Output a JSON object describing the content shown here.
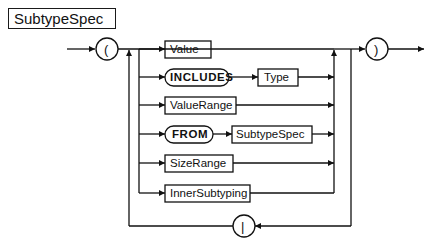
{
  "title": "SubtypeSpec",
  "diagram": {
    "type": "syntax-railroad",
    "open_symbol": "(",
    "close_symbol": ")",
    "separator_symbol": "|",
    "alternatives": [
      {
        "items": [
          {
            "kind": "nonterminal",
            "label": "Value"
          }
        ]
      },
      {
        "items": [
          {
            "kind": "keyword",
            "label": "INCLUDES"
          },
          {
            "kind": "nonterminal",
            "label": "Type"
          }
        ]
      },
      {
        "items": [
          {
            "kind": "nonterminal",
            "label": "ValueRange"
          }
        ]
      },
      {
        "items": [
          {
            "kind": "keyword",
            "label": "FROM"
          },
          {
            "kind": "nonterminal",
            "label": "SubtypeSpec"
          }
        ]
      },
      {
        "items": [
          {
            "kind": "nonterminal",
            "label": "SizeRange"
          }
        ]
      },
      {
        "items": [
          {
            "kind": "nonterminal",
            "label": "InnerSubtyping"
          }
        ]
      }
    ]
  },
  "colors": {
    "ink": "#111111",
    "background": "#ffffff"
  }
}
